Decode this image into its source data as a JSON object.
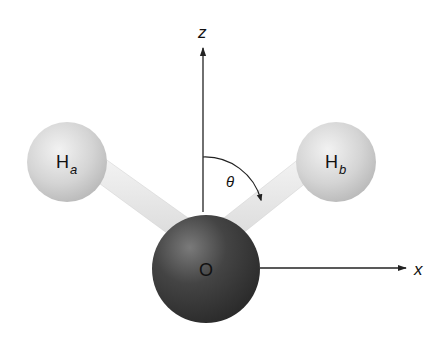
{
  "diagram": {
    "axes": {
      "z_label": "z",
      "x_label": "x"
    },
    "atoms": [
      {
        "id": "Ha",
        "symbol": "H",
        "subscript": "a"
      },
      {
        "id": "Hb",
        "symbol": "H",
        "subscript": "b"
      },
      {
        "id": "O",
        "symbol": "O"
      }
    ],
    "angle_label": "θ",
    "colors": {
      "hydrogen": "#d6d6d6",
      "oxygen": "#3a3a3a",
      "bond": "#e4e4e4",
      "axis": "#222222"
    }
  }
}
